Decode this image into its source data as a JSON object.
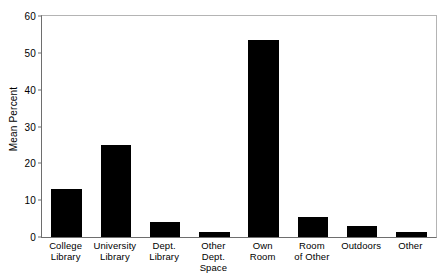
{
  "chart_data": {
    "type": "bar",
    "title": "",
    "xlabel": "",
    "ylabel": "Mean Percent",
    "categories": [
      "College\nLibrary",
      "University\nLibrary",
      "Dept.\nLibrary",
      "Other\nDept. Space",
      "Own\nRoom",
      "Room\nof Other",
      "Outdoors",
      "Other"
    ],
    "values": [
      13,
      25,
      4,
      1.3,
      53.5,
      5.4,
      3,
      1.4
    ],
    "ylim": [
      0,
      60
    ],
    "yticks": [
      0,
      10,
      20,
      30,
      40,
      50,
      60
    ],
    "ytick_labels": [
      "0",
      "10",
      "20",
      "30",
      "40",
      "50",
      "60"
    ],
    "grid": false,
    "legend": false,
    "bar_color": "#000000",
    "frame_color": "#b4b4b4",
    "axis_color": "#6e6e6e"
  }
}
